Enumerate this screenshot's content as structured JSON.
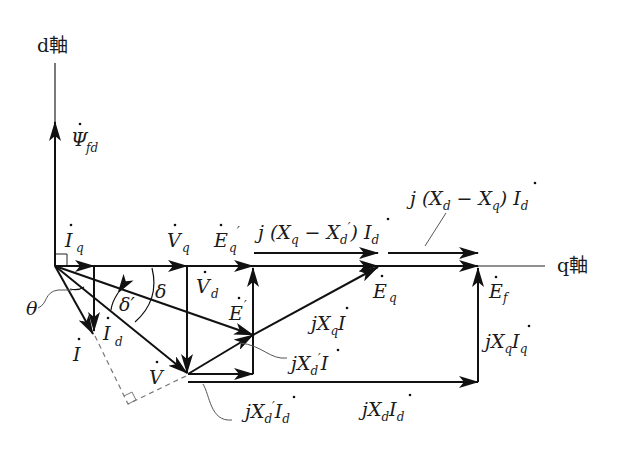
{
  "diagram": {
    "type": "phasor-diagram",
    "axes": {
      "d_axis": "d軸",
      "q_axis": "q軸"
    },
    "phasors": {
      "psi_fd": {
        "symbol": "Ψ",
        "sub": "fd"
      },
      "I_q": {
        "symbol": "I",
        "sub": "q"
      },
      "I_d": {
        "symbol": "I",
        "sub": "d"
      },
      "I": {
        "symbol": "I"
      },
      "V_q": {
        "symbol": "V",
        "sub": "q"
      },
      "V_d": {
        "symbol": "V",
        "sub": "d"
      },
      "V": {
        "symbol": "V"
      },
      "E_q_prime": {
        "symbol": "E",
        "sub": "q",
        "prime": "′"
      },
      "E_prime": {
        "symbol": "E",
        "prime": "′"
      },
      "E_q": {
        "symbol": "E",
        "sub": "q"
      },
      "E_f": {
        "symbol": "E",
        "sub": "f"
      }
    },
    "angles": {
      "theta": "θ",
      "delta": "δ",
      "delta_prime": "δ′"
    },
    "drops": {
      "jXq_minus_Xdp_Id": {
        "pre": "j (X",
        "s1": "q",
        "mid": " − X",
        "s2": "d",
        "prime": "′",
        "post": ") I",
        "s3": "d"
      },
      "jXd_minus_Xq_Id": {
        "pre": "j (X",
        "s1": "d",
        "mid": " − X",
        "s2": "q",
        "post": ") I",
        "s3": "d"
      },
      "jXqI": {
        "pre": "jX",
        "s1": "q",
        "post": "I"
      },
      "jXdpI": {
        "pre": "jX",
        "s1": "d",
        "prime": "′",
        "post": "I"
      },
      "jXdpId": {
        "pre": "jX",
        "s1": "d",
        "prime": "′",
        "post": "I",
        "s2": "d"
      },
      "jXdId": {
        "pre": "jX",
        "s1": "d",
        "post": "I",
        "s2": "d"
      },
      "jXqIq": {
        "pre": "jX",
        "s1": "q",
        "post": "I",
        "s2": "q"
      }
    }
  }
}
